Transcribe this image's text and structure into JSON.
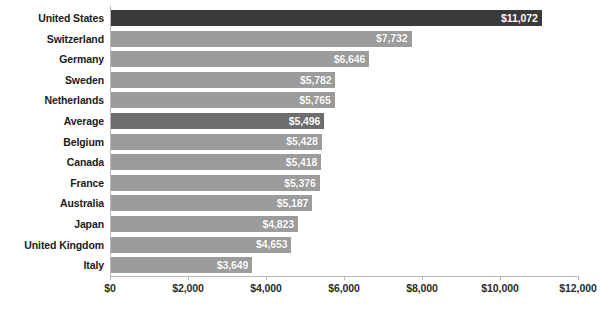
{
  "chart_data": {
    "type": "bar",
    "orientation": "horizontal",
    "title": "",
    "subtitle": "",
    "xlabel": "",
    "ylabel": "",
    "xlim": [
      0,
      12000
    ],
    "grid": false,
    "legend": null,
    "tick_labels": [
      "$0",
      "$2,000",
      "$4,000",
      "$6,000",
      "$8,000",
      "$10,000",
      "$12,000"
    ],
    "tick_values": [
      0,
      2000,
      4000,
      6000,
      8000,
      10000,
      12000
    ],
    "categories": [
      "United States",
      "Switzerland",
      "Germany",
      "Sweden",
      "Netherlands",
      "Average",
      "Belgium",
      "Canada",
      "France",
      "Australia",
      "Japan",
      "United Kingdom",
      "Italy"
    ],
    "values": [
      11072,
      7732,
      6646,
      5782,
      5765,
      5496,
      5428,
      5418,
      5376,
      5187,
      4823,
      4653,
      3649
    ],
    "value_labels": [
      "$11,072",
      "$7,732",
      "$6,646",
      "$5,782",
      "$5,765",
      "$5,496",
      "$5,428",
      "$5,418",
      "$5,376",
      "$5,187",
      "$4,823",
      "$4,653",
      "$3,649"
    ],
    "bar_styles": [
      "accent-dark",
      "default",
      "default",
      "default",
      "default",
      "accent-mid",
      "default",
      "default",
      "default",
      "default",
      "default",
      "default",
      "default"
    ],
    "colors": {
      "bar_default": "#9c9c9c",
      "bar_accent_dark": "#3a3a3a",
      "bar_accent_mid": "#6d6d6d",
      "value_label": "#ffffff",
      "category_label": "#1b1b1b",
      "axis": "#b9b9b9",
      "background": "#ffffff"
    }
  },
  "caption": ""
}
